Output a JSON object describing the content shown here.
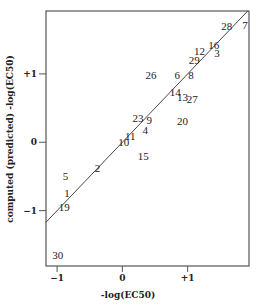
{
  "chart_data": {
    "type": "scatter",
    "title": "",
    "xlabel": "-log(EC50)",
    "ylabel": "computed (predicted) -log(EC50)",
    "xlim": [
      -1.17,
      1.94
    ],
    "ylim": [
      -1.81,
      1.92
    ],
    "grid": false,
    "legend": null,
    "x_ticks": [
      {
        "value": -1,
        "label": "−1"
      },
      {
        "value": 0,
        "label": "0"
      },
      {
        "value": 1,
        "label": "+1"
      }
    ],
    "y_ticks": [
      {
        "value": 1,
        "label": "+1"
      },
      {
        "value": 0,
        "label": "0"
      },
      {
        "value": -1,
        "label": "−1"
      }
    ],
    "marker": "numeric-label",
    "reference_line": {
      "type": "identity",
      "x1": -1.17,
      "y1": -1.17,
      "x2": 1.92,
      "y2": 1.92
    },
    "points": [
      {
        "label": "28",
        "x": 1.6,
        "y": 1.7
      },
      {
        "label": "7",
        "x": 1.88,
        "y": 1.72
      },
      {
        "label": "16",
        "x": 1.4,
        "y": 1.42
      },
      {
        "label": "12",
        "x": 1.18,
        "y": 1.34
      },
      {
        "label": "3",
        "x": 1.45,
        "y": 1.3
      },
      {
        "label": "29",
        "x": 1.1,
        "y": 1.21
      },
      {
        "label": "26",
        "x": 0.44,
        "y": 0.99
      },
      {
        "label": "6",
        "x": 0.84,
        "y": 0.99
      },
      {
        "label": "8",
        "x": 1.05,
        "y": 0.99
      },
      {
        "label": "14",
        "x": 0.81,
        "y": 0.73
      },
      {
        "label": "13",
        "x": 0.92,
        "y": 0.66
      },
      {
        "label": "27",
        "x": 1.07,
        "y": 0.63
      },
      {
        "label": "20",
        "x": 0.92,
        "y": 0.31
      },
      {
        "label": "23",
        "x": 0.24,
        "y": 0.35
      },
      {
        "label": "9",
        "x": 0.41,
        "y": 0.32
      },
      {
        "label": "4",
        "x": 0.35,
        "y": 0.18
      },
      {
        "label": "11",
        "x": 0.12,
        "y": 0.09
      },
      {
        "label": "10",
        "x": 0.02,
        "y": 0.0
      },
      {
        "label": "15",
        "x": 0.32,
        "y": -0.2
      },
      {
        "label": "2",
        "x": -0.38,
        "y": -0.38
      },
      {
        "label": "5",
        "x": -0.87,
        "y": -0.5
      },
      {
        "label": "1",
        "x": -0.85,
        "y": -0.74
      },
      {
        "label": "19",
        "x": -0.89,
        "y": -0.95
      },
      {
        "label": "30",
        "x": -0.99,
        "y": -1.65
      }
    ]
  },
  "style": {
    "axis_color": "#555555",
    "text_color": "#222222",
    "line_color": "#333333",
    "background": "#ffffff"
  }
}
